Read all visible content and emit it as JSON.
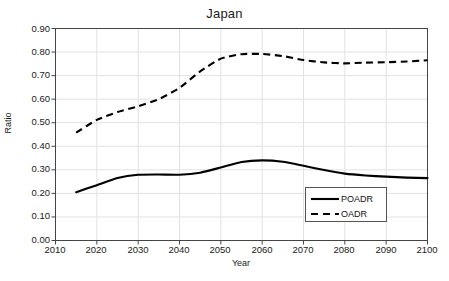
{
  "chart_data": {
    "type": "line",
    "title": "Japan",
    "xlabel": "Year",
    "ylabel": "Ratio",
    "xlim": [
      2010,
      2100
    ],
    "ylim": [
      0.0,
      0.9
    ],
    "xticks": [
      "2010",
      "2020",
      "2030",
      "2040",
      "2050",
      "2060",
      "2070",
      "2080",
      "2090",
      "2100"
    ],
    "yticks": [
      "0.00",
      "0.10",
      "0.20",
      "0.30",
      "0.40",
      "0.50",
      "0.60",
      "0.70",
      "0.80",
      "0.90"
    ],
    "grid": true,
    "legend_position": "lower-right",
    "x": [
      2015,
      2020,
      2025,
      2030,
      2035,
      2040,
      2045,
      2050,
      2055,
      2060,
      2065,
      2070,
      2075,
      2080,
      2085,
      2090,
      2095,
      2100
    ],
    "series": [
      {
        "name": "POADR",
        "style": "solid",
        "color": "#000000",
        "values": [
          0.205,
          0.235,
          0.265,
          0.279,
          0.28,
          0.279,
          0.288,
          0.31,
          0.333,
          0.34,
          0.334,
          0.317,
          0.299,
          0.284,
          0.276,
          0.271,
          0.267,
          0.265
        ]
      },
      {
        "name": "OADR",
        "style": "dashed",
        "color": "#000000",
        "values": [
          0.458,
          0.512,
          0.545,
          0.57,
          0.6,
          0.648,
          0.718,
          0.772,
          0.791,
          0.792,
          0.783,
          0.766,
          0.756,
          0.752,
          0.755,
          0.757,
          0.76,
          0.765
        ]
      }
    ]
  },
  "legend": {
    "items": [
      {
        "label": "POADR"
      },
      {
        "label": "OADR"
      }
    ]
  }
}
